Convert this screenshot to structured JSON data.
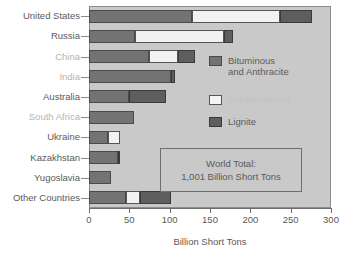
{
  "chart_data": {
    "type": "bar",
    "orientation": "horizontal",
    "stacked": true,
    "title": "",
    "xlabel": "Billion Short Tons",
    "ylabel": "",
    "xlim": [
      0,
      300
    ],
    "xticks": [
      0,
      50,
      100,
      150,
      200,
      250,
      300
    ],
    "xtick_labels": [
      "0",
      "50",
      "100",
      "150",
      "200",
      "250",
      "300"
    ],
    "grid": false,
    "legend_position": "inside-right",
    "categories": [
      "United States",
      "Russia",
      "China",
      "India",
      "Australia",
      "South Africa",
      "Ukraine",
      "Kazakhstan",
      "Yugoslavia",
      "Other Countries"
    ],
    "series": [
      {
        "name": "Bituminous and Anthracite",
        "color": "#737373",
        "values": [
          128,
          57,
          74,
          102,
          49,
          56,
          23,
          36,
          27,
          46
        ]
      },
      {
        "name": "Subbituminous",
        "color": "#f2f2f2",
        "values": [
          109,
          110,
          36,
          0,
          0,
          0,
          16,
          0,
          0,
          17
        ]
      },
      {
        "name": "Lignite",
        "color": "#5e5e5e",
        "values": [
          39,
          11,
          22,
          5,
          46,
          0,
          0,
          3,
          0,
          39
        ]
      }
    ],
    "annotations": [
      {
        "line1": "World Total:",
        "line2": "1,001 Billion Short Tons"
      }
    ]
  },
  "legend": {
    "items": [
      {
        "label_line1": "Bituminous",
        "label_line2": "and Anthracite",
        "swatch": "bit",
        "faded": false
      },
      {
        "label_line1": "Subbituminous",
        "label_line2": "",
        "swatch": "sub",
        "faded": true
      },
      {
        "label_line1": "Lignite",
        "label_line2": "",
        "swatch": "lig",
        "faded": false
      }
    ]
  },
  "callout": {
    "line1": "World Total:",
    "line2": "1,001 Billion Short Tons"
  },
  "axis": {
    "x_title": "Billion Short Tons"
  },
  "category_style": {
    "dim_indices": [
      2,
      3,
      5
    ]
  },
  "colors": {
    "plot_background": "#c9c9c9",
    "page_background": "#ffffff",
    "text": "#5a5a5a",
    "text_dim": "#b4b4b4",
    "bituminous": "#737373",
    "subbituminous": "#f2f2f2",
    "lignite": "#5e5e5e",
    "axis_line": "#6e6e6e"
  }
}
